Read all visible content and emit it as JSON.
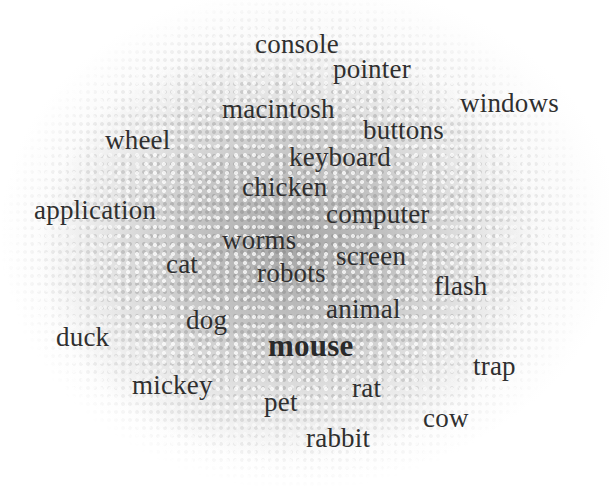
{
  "diagram": {
    "type": "word-cloud",
    "focus_word": "mouse",
    "background": "gray stippled density cloud",
    "text_color": "#2f2f2f",
    "words": [
      {
        "text": "console",
        "x": 255,
        "y": 52,
        "bold": false
      },
      {
        "text": "pointer",
        "x": 333,
        "y": 77,
        "bold": false
      },
      {
        "text": "windows",
        "x": 460,
        "y": 111,
        "bold": false
      },
      {
        "text": "macintosh",
        "x": 222,
        "y": 117,
        "bold": false
      },
      {
        "text": "buttons",
        "x": 363,
        "y": 138,
        "bold": false
      },
      {
        "text": "wheel",
        "x": 105,
        "y": 148,
        "bold": false
      },
      {
        "text": "keyboard",
        "x": 289,
        "y": 165,
        "bold": false
      },
      {
        "text": "chicken",
        "x": 242,
        "y": 195,
        "bold": false
      },
      {
        "text": "application",
        "x": 34,
        "y": 218,
        "bold": false
      },
      {
        "text": "computer",
        "x": 326,
        "y": 222,
        "bold": false
      },
      {
        "text": "worms",
        "x": 222,
        "y": 248,
        "bold": false
      },
      {
        "text": "screen",
        "x": 336,
        "y": 264,
        "bold": false
      },
      {
        "text": "cat",
        "x": 166,
        "y": 272,
        "bold": false
      },
      {
        "text": "robots",
        "x": 257,
        "y": 281,
        "bold": false
      },
      {
        "text": "flash",
        "x": 434,
        "y": 294,
        "bold": false
      },
      {
        "text": "animal",
        "x": 326,
        "y": 317,
        "bold": false
      },
      {
        "text": "dog",
        "x": 186,
        "y": 328,
        "bold": false
      },
      {
        "text": "duck",
        "x": 56,
        "y": 345,
        "bold": false
      },
      {
        "text": "mouse",
        "x": 268,
        "y": 354,
        "bold": true
      },
      {
        "text": "trap",
        "x": 473,
        "y": 374,
        "bold": false
      },
      {
        "text": "mickey",
        "x": 132,
        "y": 393,
        "bold": false
      },
      {
        "text": "rat",
        "x": 352,
        "y": 396,
        "bold": false
      },
      {
        "text": "pet",
        "x": 264,
        "y": 410,
        "bold": false
      },
      {
        "text": "cow",
        "x": 423,
        "y": 426,
        "bold": false
      },
      {
        "text": "rabbit",
        "x": 306,
        "y": 446,
        "bold": false
      }
    ]
  }
}
